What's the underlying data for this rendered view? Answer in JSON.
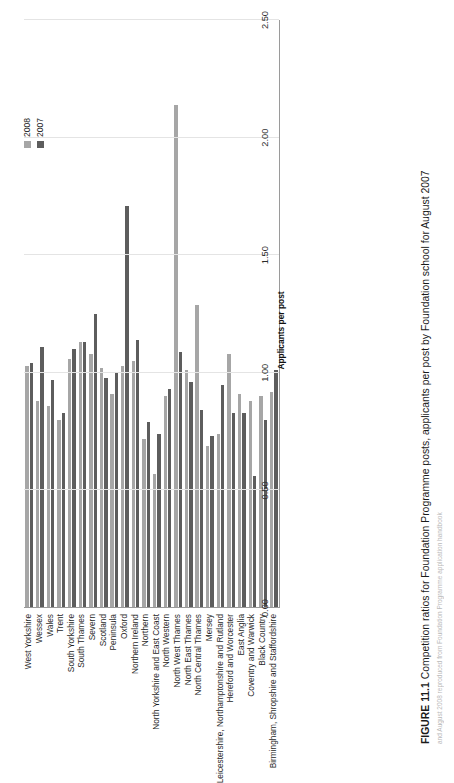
{
  "figure": {
    "number_label": "FIGURE 11.1",
    "caption": "Competition ratios for Foundation Programme posts, applicants per post by Foundation school for August 2007",
    "source_note": "and August 2008 reproduced from Foundation Programme application handbook"
  },
  "legend": {
    "position": "top-right",
    "items": [
      {
        "label": "2008",
        "color": "#a6a6a6"
      },
      {
        "label": "2007",
        "color": "#5d5d5d"
      }
    ]
  },
  "chart_data": {
    "type": "bar",
    "orientation": "horizontal",
    "title": "Competition ratios for Foundation Programme posts, applicants per post by Foundation school for August 2007",
    "xlabel": "Applicants per post",
    "ylabel": "",
    "xlim": [
      0.0,
      2.5
    ],
    "xticks": [
      "0.00",
      "0.50",
      "1.00",
      "1.50",
      "2.00",
      "2.50"
    ],
    "xtick_values": [
      0.0,
      0.5,
      1.0,
      1.5,
      2.0,
      2.5
    ],
    "grid": true,
    "categories": [
      "West Yorkshire",
      "Wessex",
      "Wales",
      "Trent",
      "South Yorkshire",
      "South Thames",
      "Severn",
      "Scotland",
      "Peninsula",
      "Oxford",
      "Northern Ireland",
      "Northern",
      "North Yorkshire and East Coast",
      "North Western",
      "North West Thames",
      "North East Thames",
      "North Central Thames",
      "Mersey",
      "Leicestershire, Northamptonshire and Rutland",
      "Hereford and Worcester",
      "East Anglia",
      "Coventry and Warwick",
      "Black Country",
      "Birmingham, Shropshire and Staffordshire"
    ],
    "series": [
      {
        "name": "2008",
        "color": "#a6a6a6",
        "values": [
          1.03,
          0.88,
          0.86,
          0.8,
          1.06,
          1.13,
          1.08,
          1.02,
          0.91,
          1.03,
          1.05,
          0.72,
          0.57,
          0.9,
          2.14,
          1.01,
          1.29,
          0.69,
          0.74,
          1.08,
          0.91,
          0.88,
          0.9,
          0.92
        ]
      },
      {
        "name": "2007",
        "color": "#5d5d5d",
        "values": [
          1.04,
          1.11,
          0.97,
          0.83,
          1.1,
          1.13,
          1.25,
          0.98,
          1.0,
          1.71,
          1.14,
          0.79,
          0.74,
          0.93,
          1.09,
          0.96,
          0.84,
          0.73,
          0.95,
          0.83,
          0.83,
          0.56,
          0.8,
          1.01
        ]
      }
    ]
  }
}
